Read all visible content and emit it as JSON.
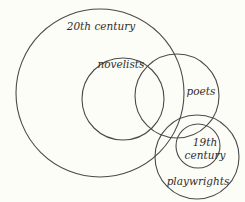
{
  "diagram": {
    "type": "venn",
    "background": "#fdfdf8",
    "stroke_color": "#4a4a4a",
    "sets": [
      {
        "id": "twentieth-century",
        "label": "20th century",
        "cx": 100,
        "cy": 93,
        "r": 84,
        "label_x": 101,
        "label_y": 30
      },
      {
        "id": "novelists",
        "label": "novelists",
        "cx": 123,
        "cy": 99,
        "r": 41,
        "label_x": 121,
        "label_y": 68
      },
      {
        "id": "poets",
        "label": "poets",
        "cx": 177,
        "cy": 96,
        "r": 42,
        "label_x": 201,
        "label_y": 95
      },
      {
        "id": "playwrights",
        "label": "playwrights",
        "cx": 197,
        "cy": 157,
        "r": 42,
        "label_x": 198,
        "label_y": 185
      },
      {
        "id": "nineteenth-century",
        "label_line1": "19th",
        "label_line2": "century",
        "cx": 198,
        "cy": 146,
        "r": 22,
        "label_x": 205,
        "label_y1": 146,
        "label_y2": 159
      }
    ]
  }
}
